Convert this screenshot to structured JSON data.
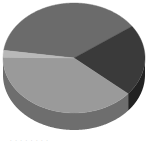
{
  "chart_data": {
    "type": "pie",
    "style": "3d",
    "title": "",
    "categories": [
      "Slice A",
      "Slice B",
      "Slice C",
      "Slice D"
    ],
    "values": [
      38,
      21,
      39,
      2
    ],
    "colors": [
      "#6b6b6b",
      "#3a3a3a",
      "#9a9a9a",
      "#b8b8b8"
    ],
    "side_colors": [
      "#555555",
      "#222222",
      "#6e6e6e",
      "#8a8a8a"
    ],
    "start_angle_deg": 172,
    "direction": "clockwise",
    "legend": "none",
    "data_labels": "none"
  },
  "caption": "· · · · · · · ·"
}
